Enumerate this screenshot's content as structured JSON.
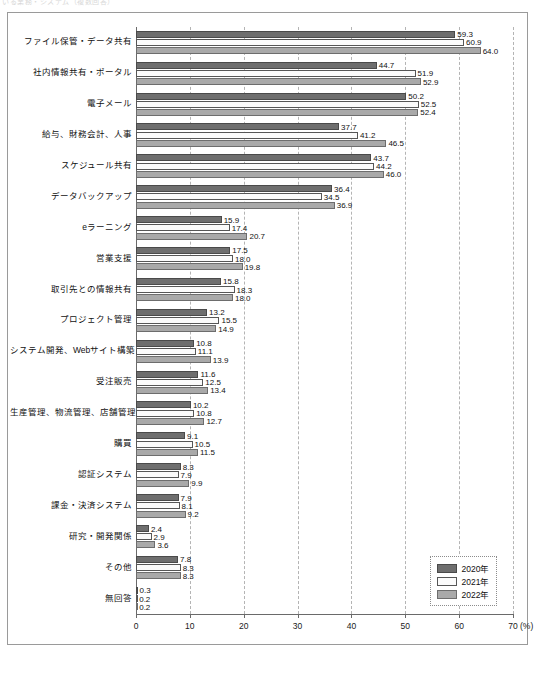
{
  "page": {
    "header_faint_text": "いる業務・システム（複数回答）"
  },
  "chart_data": {
    "type": "bar",
    "orientation": "horizontal",
    "title": "",
    "xlabel": "(%)",
    "ylabel": "",
    "xlim": [
      0,
      70
    ],
    "xticks": [
      0,
      10,
      20,
      30,
      40,
      50,
      60,
      70
    ],
    "xtick_labels": [
      "0",
      "10",
      "20",
      "30",
      "40",
      "50",
      "60",
      "70"
    ],
    "x_unit_label": "(%)",
    "grid": "vertical-dashed",
    "legend_position": "bottom-right",
    "categories": [
      "ファイル保管・データ共有",
      "社内情報共有・ポータル",
      "電子メール",
      "給与、財務会計、人事",
      "スケジュール共有",
      "データバックアップ",
      "eラーニング",
      "営業支援",
      "取引先との情報共有",
      "プロジェクト管理",
      "システム開発、Webサイト構築",
      "受注販売",
      "生産管理、物流管理、店舗管理",
      "購買",
      "認証システム",
      "課金・決済システム",
      "研究・開発関係",
      "その他",
      "無回答"
    ],
    "series": [
      {
        "name": "2020年",
        "color": "#6e6e6e",
        "values": [
          59.3,
          44.7,
          50.2,
          37.7,
          43.7,
          36.4,
          15.9,
          17.5,
          15.8,
          13.2,
          10.8,
          11.6,
          10.2,
          9.1,
          8.3,
          7.9,
          2.4,
          7.8,
          0.3
        ]
      },
      {
        "name": "2021年",
        "color": "#fbfbfb",
        "values": [
          60.9,
          51.9,
          52.5,
          41.2,
          44.2,
          34.5,
          17.4,
          18.0,
          18.3,
          15.5,
          11.1,
          12.5,
          10.8,
          10.5,
          7.9,
          8.1,
          2.9,
          8.3,
          0.2
        ]
      },
      {
        "name": "2022年",
        "color": "#a9a9a9",
        "values": [
          64.0,
          52.9,
          52.4,
          46.5,
          46.0,
          36.9,
          20.7,
          19.8,
          18.0,
          14.9,
          13.9,
          13.4,
          12.7,
          11.5,
          9.9,
          9.2,
          3.6,
          8.3,
          0.2
        ]
      }
    ]
  },
  "legend": {
    "items": [
      {
        "label": "2020年",
        "color": "#6e6e6e"
      },
      {
        "label": "2021年",
        "color": "#fbfbfb"
      },
      {
        "label": "2022年",
        "color": "#a9a9a9"
      }
    ]
  }
}
